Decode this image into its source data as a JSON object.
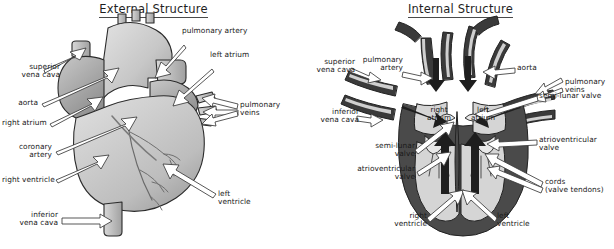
{
  "figure": {
    "background_color": "#ffffff",
    "ink_color": "#1a1a1a"
  },
  "panels": {
    "external": {
      "title": "External Structure",
      "labels": {
        "superior_vena_cava": "superior\nvena cava",
        "aorta": "aorta",
        "right_atrium": "right atrium",
        "coronary_artery": "coronary\nartery",
        "right_ventricle": "right ventricle",
        "inferior_vena_cava": "inferior\nvena cava",
        "pulmonary_artery": "pulmonary artery",
        "left_atrium": "left atrium",
        "pulmonary_veins": "pulmonary\nveins",
        "left_ventricle": "left\nventricle"
      }
    },
    "internal": {
      "title": "Internal Structure",
      "labels": {
        "superior_vena_cava": "superior\nvena cava",
        "pulmonary_artery": "pulmonary\nartery",
        "inferior_vena_cava": "inferior\nvena cava",
        "semi_lunar_valve_left": "semi-lunar\nvalve",
        "atrioventricular_valve_left": "atrioventricular\nvalve",
        "right_ventricle": "right\nventricle",
        "aorta": "aorta",
        "pulmonary_veins": "pulmonary\nveins",
        "semi_lunar_valve_right": "semi-lunar valve",
        "atrioventricular_valve_right": "atrioventricular\nvalve",
        "cords": "cords\n(valve tendons)",
        "left_ventricle": "left\nventricle",
        "right_atrium": "right\natrium",
        "left_atrium": "left\natrium"
      }
    }
  },
  "colors": {
    "outline": "#2b2b2b",
    "muscle_wall": "#4a4a4a",
    "chamber_fill": "#d5d5d5",
    "surface_light": "#dcdcdc",
    "surface_mid": "#b9b9b9",
    "surface_dark": "#8f8f8f",
    "vessel_dark": "#3a3a3a",
    "arrow_fill": "#ffffff"
  }
}
